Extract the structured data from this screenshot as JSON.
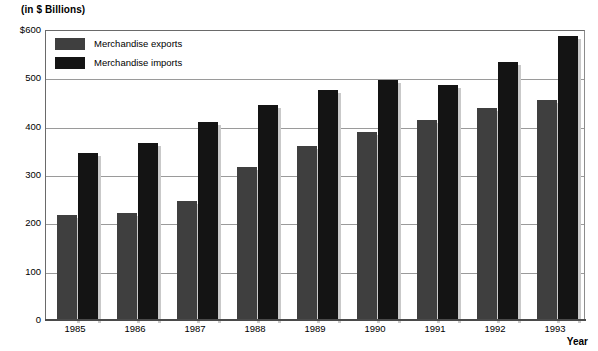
{
  "chart_data": {
    "type": "bar",
    "title": "(in $ Billions)",
    "xlabel": "Year",
    "ylabel": "(in $ Billions)",
    "categories": [
      "1985",
      "1986",
      "1987",
      "1988",
      "1989",
      "1990",
      "1991",
      "1992",
      "1993"
    ],
    "series": [
      {
        "name": "Merchandise exports",
        "color": "#3f3f3f",
        "values": [
          217,
          222,
          247,
          317,
          360,
          389,
          414,
          438,
          455
        ]
      },
      {
        "name": "Merchandise imports",
        "color": "#141414",
        "values": [
          345,
          366,
          410,
          445,
          475,
          497,
          487,
          534,
          587
        ]
      }
    ],
    "ylim": [
      0,
      600
    ],
    "yticks": [
      "$600",
      "500",
      "400",
      "300",
      "200",
      "100",
      "0"
    ],
    "ytick_values": [
      600,
      500,
      400,
      300,
      200,
      100,
      0
    ],
    "grid": true,
    "legend_position": "top-left"
  },
  "legend": {
    "items": [
      {
        "label": "Merchandise exports"
      },
      {
        "label": "Merchandise imports"
      }
    ]
  }
}
